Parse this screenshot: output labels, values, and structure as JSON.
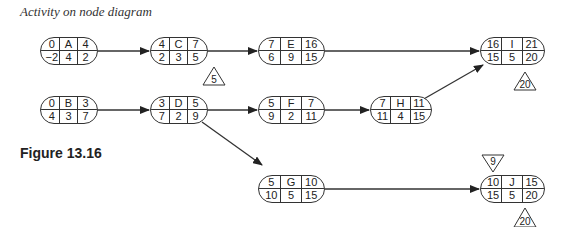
{
  "caption": "Activity on node diagram",
  "figure_label": "Figure 13.16",
  "legend_note": "Node cells: top row = earliest start | activity | earliest finish; bottom row = latest start | duration | latest finish",
  "nodes": {
    "A": {
      "es": "0",
      "id": "A",
      "ef": "4",
      "ls": "−2",
      "dur": "4",
      "lf": "2"
    },
    "B": {
      "es": "0",
      "id": "B",
      "ef": "3",
      "ls": "4",
      "dur": "3",
      "lf": "7"
    },
    "C": {
      "es": "4",
      "id": "C",
      "ef": "7",
      "ls": "2",
      "dur": "3",
      "lf": "5"
    },
    "D": {
      "es": "3",
      "id": "D",
      "ef": "5",
      "ls": "7",
      "dur": "2",
      "lf": "9"
    },
    "E": {
      "es": "7",
      "id": "E",
      "ef": "16",
      "ls": "6",
      "dur": "9",
      "lf": "15"
    },
    "F": {
      "es": "5",
      "id": "F",
      "ef": "7",
      "ls": "9",
      "dur": "2",
      "lf": "11"
    },
    "G": {
      "es": "5",
      "id": "G",
      "ef": "10",
      "ls": "10",
      "dur": "5",
      "lf": "15"
    },
    "H": {
      "es": "7",
      "id": "H",
      "ef": "11",
      "ls": "11",
      "dur": "4",
      "lf": "15"
    },
    "I": {
      "es": "16",
      "id": "I",
      "ef": "21",
      "ls": "15",
      "dur": "5",
      "lf": "20"
    },
    "J": {
      "es": "10",
      "id": "J",
      "ef": "15",
      "ls": "15",
      "dur": "5",
      "lf": "20"
    }
  },
  "edges": [
    [
      "A",
      "C"
    ],
    [
      "C",
      "E"
    ],
    [
      "E",
      "I"
    ],
    [
      "B",
      "D"
    ],
    [
      "D",
      "F"
    ],
    [
      "F",
      "H"
    ],
    [
      "H",
      "I"
    ],
    [
      "D",
      "G"
    ],
    [
      "G",
      "J"
    ]
  ],
  "markers": {
    "c_d_constraint": "5",
    "i_deadline": "20",
    "j_start_constraint": "9",
    "j_deadline": "20"
  }
}
